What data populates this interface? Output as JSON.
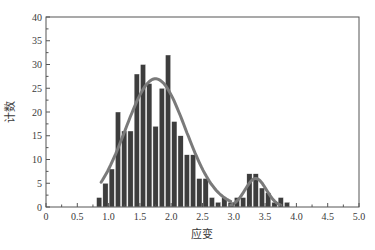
{
  "chart_data": {
    "type": "bar",
    "title": "",
    "xlabel": "应变",
    "ylabel": "计数",
    "xlim": [
      0,
      5.0
    ],
    "ylim": [
      0,
      40
    ],
    "xticks": [
      "0",
      "0.5",
      "1.0",
      "1.5",
      "2.0",
      "2.5",
      "3.0",
      "3.5",
      "4.0",
      "4.5",
      "5.0"
    ],
    "yticks": [
      "0",
      "5",
      "10",
      "15",
      "20",
      "25",
      "30",
      "35",
      "40"
    ],
    "grid": false,
    "legend": null,
    "bin_width": 0.1,
    "bins": [
      {
        "x": 0.85,
        "count": 2
      },
      {
        "x": 0.95,
        "count": 5
      },
      {
        "x": 1.05,
        "count": 8
      },
      {
        "x": 1.15,
        "count": 20
      },
      {
        "x": 1.25,
        "count": 16
      },
      {
        "x": 1.35,
        "count": 16
      },
      {
        "x": 1.45,
        "count": 28
      },
      {
        "x": 1.55,
        "count": 30
      },
      {
        "x": 1.65,
        "count": 26
      },
      {
        "x": 1.75,
        "count": 17
      },
      {
        "x": 1.85,
        "count": 25
      },
      {
        "x": 1.95,
        "count": 32
      },
      {
        "x": 2.05,
        "count": 18
      },
      {
        "x": 2.15,
        "count": 15
      },
      {
        "x": 2.25,
        "count": 11
      },
      {
        "x": 2.35,
        "count": 11
      },
      {
        "x": 2.45,
        "count": 6
      },
      {
        "x": 2.55,
        "count": 6
      },
      {
        "x": 2.65,
        "count": 2
      },
      {
        "x": 2.75,
        "count": 1
      },
      {
        "x": 2.85,
        "count": 2
      },
      {
        "x": 2.95,
        "count": 1
      },
      {
        "x": 3.05,
        "count": 2
      },
      {
        "x": 3.15,
        "count": 2
      },
      {
        "x": 3.25,
        "count": 7
      },
      {
        "x": 3.35,
        "count": 7
      },
      {
        "x": 3.45,
        "count": 4
      },
      {
        "x": 3.55,
        "count": 3
      },
      {
        "x": 3.65,
        "count": 1
      },
      {
        "x": 3.75,
        "count": 2
      },
      {
        "x": 3.85,
        "count": 1
      }
    ],
    "fit_curves": [
      {
        "name": "gaussian-fit-1",
        "peak_x": 1.75,
        "peak_y": 27,
        "sigma": 0.48,
        "x_range": [
          0.88,
          2.95
        ]
      },
      {
        "name": "gaussian-fit-2",
        "peak_x": 3.35,
        "peak_y": 6,
        "sigma": 0.17,
        "x_range": [
          2.95,
          3.75
        ]
      }
    ],
    "colors": {
      "bar_fill": "#3d3d3d",
      "bar_edge": "#ffffff",
      "curve": "#7a7a7a",
      "axis": "#555555"
    }
  }
}
